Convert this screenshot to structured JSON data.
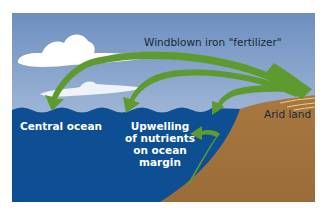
{
  "diagram": {
    "labels": {
      "windblown": "Windblown iron \"fertilizer\"",
      "arid_land": "Arid land",
      "central_ocean": "Central ocean",
      "upwelling": [
        "Upwelling",
        "of nutrients",
        "on ocean",
        "margin"
      ]
    },
    "colors": {
      "sky_top": "#6d8fc0",
      "sky_bottom": "#c6d4e6",
      "ocean": "#0d4f92",
      "land": "#a2733f",
      "arrow": "#5e9a2e",
      "cloud": "#ffffff"
    },
    "elements": [
      "clouds",
      "windblown-arrows",
      "ocean",
      "arid-land",
      "upwelling-arrow"
    ]
  }
}
